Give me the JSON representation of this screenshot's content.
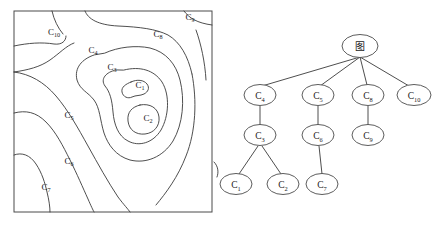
{
  "figure": {
    "title": "",
    "panels": {
      "contour": {
        "name": "contour-map",
        "border_color": "#4a4a4a",
        "line_color": "#3a3a3a",
        "labels": [
          {
            "id": "C10",
            "base": "C",
            "sub": "10",
            "x": 54,
            "y": 35
          },
          {
            "id": "C9",
            "base": "C",
            "sub": "9",
            "x": 190,
            "y": 20
          },
          {
            "id": "C8",
            "base": "C",
            "sub": "8",
            "x": 158,
            "y": 37
          },
          {
            "id": "C4",
            "base": "C",
            "sub": "4",
            "x": 93,
            "y": 53
          },
          {
            "id": "C3",
            "base": "C",
            "sub": "3",
            "x": 112,
            "y": 70
          },
          {
            "id": "C1",
            "base": "C",
            "sub": "1",
            "x": 140,
            "y": 88
          },
          {
            "id": "C2",
            "base": "C",
            "sub": "2",
            "x": 148,
            "y": 121
          },
          {
            "id": "C5",
            "base": "C",
            "sub": "5",
            "x": 69,
            "y": 118
          },
          {
            "id": "C6",
            "base": "C",
            "sub": "6",
            "x": 69,
            "y": 164
          },
          {
            "id": "C7",
            "base": "C",
            "sub": "7",
            "x": 46,
            "y": 190
          }
        ]
      },
      "tree": {
        "name": "region-adjacency-tree",
        "line_color": "#3a3a3a",
        "node_fill": "#ffffff",
        "node_stroke": "#4a4a4a",
        "nodes": [
          {
            "id": "root",
            "base": "图",
            "sub": "",
            "cx": 360,
            "cy": 46,
            "rx": 18,
            "ry": 11.5
          },
          {
            "id": "C4",
            "base": "C",
            "sub": "4",
            "cx": 260,
            "cy": 95,
            "rx": 16,
            "ry": 10.5
          },
          {
            "id": "C5",
            "base": "C",
            "sub": "5",
            "cx": 318,
            "cy": 95,
            "rx": 16,
            "ry": 10.5
          },
          {
            "id": "C8",
            "base": "C",
            "sub": "8",
            "cx": 368,
            "cy": 95,
            "rx": 16,
            "ry": 10.5
          },
          {
            "id": "C10",
            "base": "C",
            "sub": "10",
            "cx": 414,
            "cy": 95,
            "rx": 17,
            "ry": 10.5
          },
          {
            "id": "C3",
            "base": "C",
            "sub": "3",
            "cx": 260,
            "cy": 135,
            "rx": 16,
            "ry": 10.5
          },
          {
            "id": "C6",
            "base": "C",
            "sub": "6",
            "cx": 318,
            "cy": 135,
            "rx": 16,
            "ry": 10.5
          },
          {
            "id": "C9",
            "base": "C",
            "sub": "9",
            "cx": 368,
            "cy": 135,
            "rx": 16,
            "ry": 10.5
          },
          {
            "id": "C1",
            "base": "C",
            "sub": "1",
            "cx": 236,
            "cy": 184,
            "rx": 16,
            "ry": 10.5
          },
          {
            "id": "C2",
            "base": "C",
            "sub": "2",
            "cx": 283,
            "cy": 184,
            "rx": 16,
            "ry": 10.5
          },
          {
            "id": "C7",
            "base": "C",
            "sub": "7",
            "cx": 322,
            "cy": 184,
            "rx": 16,
            "ry": 10.5
          }
        ],
        "edges": [
          {
            "from": "root",
            "to": "C4"
          },
          {
            "from": "root",
            "to": "C5"
          },
          {
            "from": "root",
            "to": "C8"
          },
          {
            "from": "root",
            "to": "C10"
          },
          {
            "from": "C4",
            "to": "C3"
          },
          {
            "from": "C5",
            "to": "C6"
          },
          {
            "from": "C8",
            "to": "C9"
          },
          {
            "from": "C3",
            "to": "C1"
          },
          {
            "from": "C3",
            "to": "C2"
          },
          {
            "from": "C6",
            "to": "C7"
          }
        ]
      }
    }
  }
}
